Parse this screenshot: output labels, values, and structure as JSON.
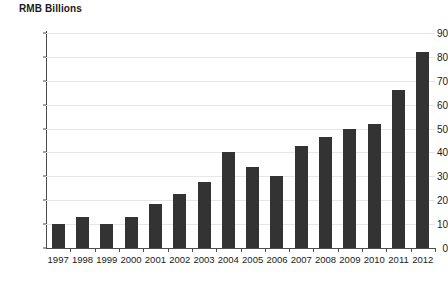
{
  "chart_data": {
    "type": "bar",
    "title": "RMB Billions",
    "xlabel": "",
    "ylabel": "",
    "ylim": [
      0,
      90
    ],
    "ytick_step": 10,
    "yticks": [
      0,
      10,
      20,
      30,
      40,
      50,
      60,
      70,
      80,
      90
    ],
    "grid": true,
    "legend": false,
    "bar_color": "#333333",
    "gridline_color": "#e6e6e6",
    "axis_color": "#4d4d4d",
    "categories": [
      "1997",
      "1998",
      "1999",
      "2000",
      "2001",
      "2002",
      "2003",
      "2004",
      "2005",
      "2006",
      "2007",
      "2008",
      "2009",
      "2010",
      "2011",
      "2012"
    ],
    "values": [
      10,
      13,
      10,
      13,
      18.5,
      22.5,
      27.5,
      40,
      34,
      30,
      42.5,
      46.5,
      50,
      52,
      66,
      82
    ]
  }
}
